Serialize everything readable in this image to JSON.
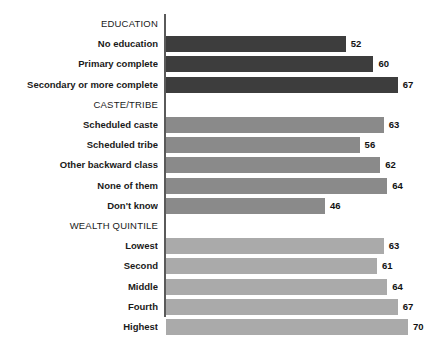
{
  "chart_data": {
    "type": "bar",
    "orientation": "horizontal",
    "title": "",
    "subtitle": "",
    "xlabel": "",
    "ylabel": "",
    "xlim": [
      0,
      70
    ],
    "grid": false,
    "legend": false,
    "axis_line_color": "#5a5a5a",
    "background": "#ffffff",
    "groups": [
      {
        "header": "EDUCATION",
        "color": "#3d3d3d",
        "categories": [
          "No education",
          "Primary complete",
          "Secondary or more complete"
        ],
        "values": [
          52,
          60,
          67
        ]
      },
      {
        "header": "CASTE/TRIBE",
        "color": "#8a8a8a",
        "categories": [
          "Scheduled caste",
          "Scheduled tribe",
          "Other backward class",
          "None of them",
          "Don't know"
        ],
        "values": [
          63,
          56,
          62,
          64,
          46
        ]
      },
      {
        "header": "WEALTH QUINTILE",
        "color": "#aaaaaa",
        "categories": [
          "Lowest",
          "Second",
          "Middle",
          "Fourth",
          "Highest"
        ],
        "values": [
          63,
          61,
          64,
          67,
          70
        ]
      }
    ]
  }
}
